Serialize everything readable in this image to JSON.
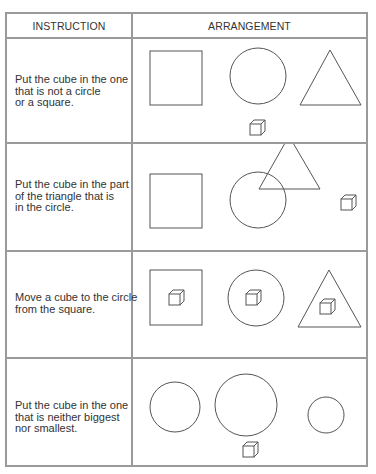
{
  "table": {
    "headers": {
      "instruction": "INSTRUCTION",
      "arrangement": "ARRANGEMENT"
    },
    "rows": [
      {
        "instruction": "Put the cube in the one\nthat is not a circle\nor a square.",
        "arrangement": "square, circle, triangle in a row; cube below the circle"
      },
      {
        "instruction": "Put the cube in the part\nof the triangle that is\nin the circle.",
        "arrangement": "square; circle overlapping a triangle; cube at right"
      },
      {
        "instruction": "Move a cube to the circle\nfrom the square.",
        "arrangement": "square, circle and triangle each containing a cube"
      },
      {
        "instruction": "Put the cube in the one\nthat is neither biggest\nnor smallest.",
        "arrangement": "medium circle, large circle, small circle; cube below the large circle"
      }
    ]
  }
}
